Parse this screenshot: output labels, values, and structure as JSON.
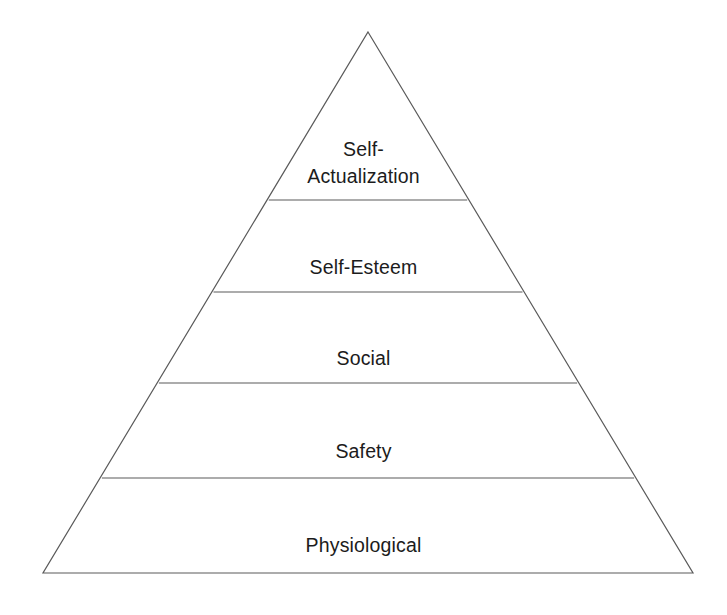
{
  "figure": {
    "name": "hierarchy-of-needs-pyramid",
    "background_color": "#ffffff",
    "line_color": "#5a5a5a",
    "text_color": "#1c1c1c"
  },
  "pyramid": {
    "apex": {
      "x": 368,
      "y": 32
    },
    "base_left": {
      "x": 43,
      "y": 573
    },
    "base_right": {
      "x": 693,
      "y": 573
    },
    "divider_y": [
      200,
      292,
      383,
      478
    ],
    "tiers": [
      {
        "id": "self-actualization",
        "rank": 5,
        "label": "Self-\nActualization",
        "label_lines": [
          "Self-",
          "Actualization"
        ]
      },
      {
        "id": "self-esteem",
        "rank": 4,
        "label": "Self-Esteem",
        "label_lines": [
          "Self-Esteem"
        ]
      },
      {
        "id": "social",
        "rank": 3,
        "label": "Social",
        "label_lines": [
          "Social"
        ]
      },
      {
        "id": "safety",
        "rank": 2,
        "label": "Safety",
        "label_lines": [
          "Safety"
        ]
      },
      {
        "id": "physiological",
        "rank": 1,
        "label": "Physiological",
        "label_lines": [
          "Physiological"
        ]
      }
    ]
  }
}
